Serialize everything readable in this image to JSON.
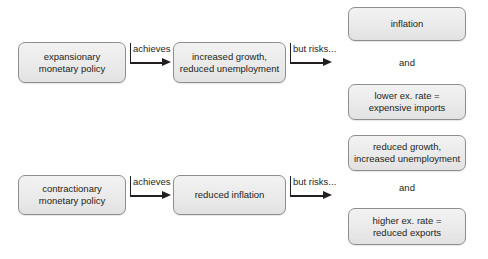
{
  "diagram": {
    "colors": {
      "box_fill_top": "#f2f2f2",
      "box_fill_bottom": "#e2e2e2",
      "box_border": "#8e8e8e",
      "text": "#231f20",
      "arrow": "#231f20",
      "background": "#ffffff"
    },
    "rows": [
      {
        "id": "expansionary-row",
        "policy": {
          "label": "expansionary\nmonetary policy"
        },
        "achieves_label": "achieves",
        "outcome": {
          "label": "increased growth,\nreduced unemployment"
        },
        "risks_label": "but risks...",
        "risks": [
          {
            "label": "inflation"
          },
          {
            "label": "lower ex. rate =\nexpensive imports"
          }
        ],
        "conjunction": "and"
      },
      {
        "id": "contractionary-row",
        "policy": {
          "label": "contractionary\nmonetary policy"
        },
        "achieves_label": "achieves",
        "outcome": {
          "label": "reduced inflation"
        },
        "risks_label": "but risks...",
        "risks": [
          {
            "label": "reduced growth,\nincreased unemployment"
          },
          {
            "label": "higher ex. rate =\nreduced exports"
          }
        ],
        "conjunction": "and"
      }
    ]
  }
}
